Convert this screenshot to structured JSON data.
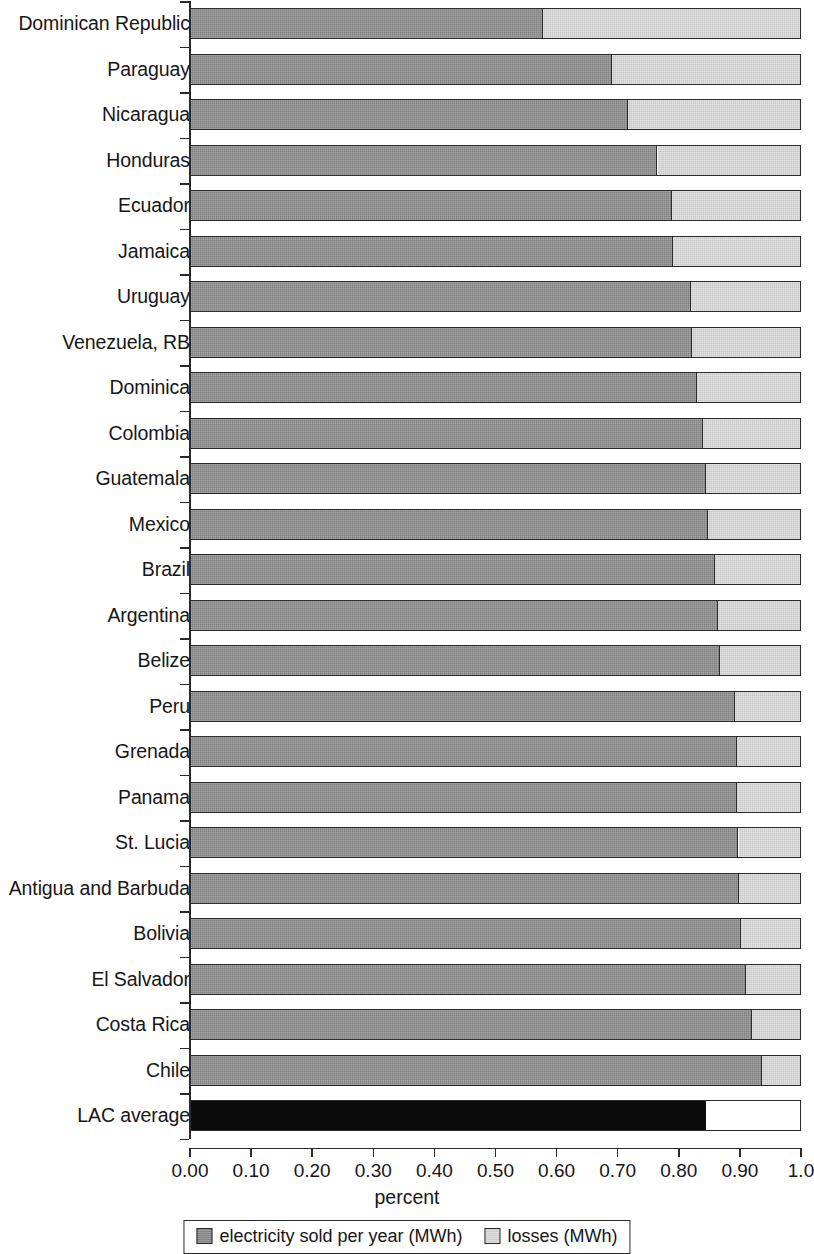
{
  "chart_data": {
    "type": "bar",
    "orientation": "horizontal",
    "stacked": true,
    "normalized": true,
    "title": "",
    "subtitle": "",
    "xlabel": "percent",
    "ylabel": "",
    "xlim": [
      0.0,
      1.0
    ],
    "grid": false,
    "legend_position": "bottom",
    "tick_labels": [
      "0.00",
      "0.10",
      "0.20",
      "0.30",
      "0.40",
      "0.50",
      "0.60",
      "0.70",
      "0.80",
      "0.90",
      "1.0"
    ],
    "tick_values": [
      0.0,
      0.1,
      0.2,
      0.3,
      0.4,
      0.5,
      0.6,
      0.7,
      0.8,
      0.9,
      1.0
    ],
    "categories": [
      "Dominican Republic",
      "Paraguay",
      "Nicaragua",
      "Honduras",
      "Ecuador",
      "Jamaica",
      "Uruguay",
      "Venezuela, RB",
      "Dominica",
      "Colombia",
      "Guatemala",
      "Mexico",
      "Brazil",
      "Argentina",
      "Belize",
      "Peru",
      "Grenada",
      "Panama",
      "St. Lucia",
      "Antigua and Barbuda",
      "Bolivia",
      "El Salvador",
      "Costa Rica",
      "Chile",
      "LAC average"
    ],
    "series": [
      {
        "name": "electricity sold per year (MWh)",
        "color": "#8d8d8d",
        "values": [
          0.578,
          0.691,
          0.717,
          0.766,
          0.79,
          0.792,
          0.821,
          0.823,
          0.831,
          0.841,
          0.846,
          0.849,
          0.861,
          0.866,
          0.868,
          0.894,
          0.897,
          0.897,
          0.899,
          0.9,
          0.903,
          0.912,
          0.921,
          0.938,
          0.845
        ]
      },
      {
        "name": "losses (MWh)",
        "color": "#d6d6d6",
        "values": [
          0.422,
          0.309,
          0.283,
          0.234,
          0.21,
          0.208,
          0.179,
          0.177,
          0.169,
          0.159,
          0.154,
          0.151,
          0.139,
          0.134,
          0.132,
          0.106,
          0.103,
          0.103,
          0.101,
          0.1,
          0.097,
          0.088,
          0.079,
          0.062,
          0.155
        ]
      }
    ],
    "average_row_index": 24,
    "average_color": "#0b0b0b"
  },
  "legend": {
    "items": [
      {
        "label": "electricity sold per year (MWh)",
        "swatch": "sold"
      },
      {
        "label": "losses (MWh)",
        "swatch": "loss"
      }
    ]
  }
}
